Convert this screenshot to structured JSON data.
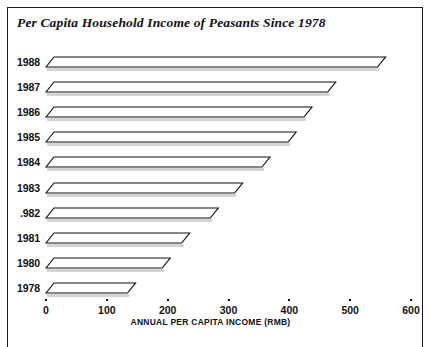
{
  "chart_data": {
    "type": "bar",
    "orientation": "horizontal",
    "style": "3d-parallelogram",
    "title": "Per Capita Household Income of Peasants Since 1978",
    "xlabel": "ANNUAL PER CAPITA INCOME (RMB)",
    "ylabel": "",
    "categories": [
      "1988",
      "1987",
      "1986",
      "1985",
      "1984",
      "1983",
      "1982",
      "1981",
      "1980",
      "1978"
    ],
    "values": [
      545,
      463,
      424,
      398,
      355,
      310,
      270,
      223,
      191,
      134
    ],
    "xlim": [
      0,
      600
    ],
    "xticks": [
      0,
      100,
      200,
      300,
      400,
      500,
      600
    ],
    "xtick_labels": [
      "0",
      "100",
      "200",
      "300",
      "400",
      "500",
      "600"
    ],
    "grid": false,
    "legend": null,
    "series": [
      {
        "name": "Annual per capita income (RMB)",
        "values": [
          545,
          463,
          424,
          398,
          355,
          310,
          270,
          223,
          191,
          134
        ]
      }
    ],
    "bars": [
      {
        "category": "1988",
        "label": "1988",
        "value": 545
      },
      {
        "category": "1987",
        "label": "1987",
        "value": 463
      },
      {
        "category": "1986",
        "label": "1986",
        "value": 424
      },
      {
        "category": "1985",
        "label": "1985",
        "value": 398
      },
      {
        "category": "1984",
        "label": "1984",
        "value": 355
      },
      {
        "category": "1983",
        "label": "1983",
        "value": 310
      },
      {
        "category": "1982",
        "label": ".982",
        "value": 270
      },
      {
        "category": "1981",
        "label": "1981",
        "value": 223
      },
      {
        "category": "1980",
        "label": "1980",
        "value": 191
      },
      {
        "category": "1978",
        "label": "1978",
        "value": 134
      }
    ],
    "colors": {
      "bar_fill": "#ffffff",
      "bar_outline": "#111111",
      "bar_shadow": "#b0b0b0",
      "text": "#111111",
      "background": "#ffffff",
      "frame": "#1a1a1a"
    }
  }
}
